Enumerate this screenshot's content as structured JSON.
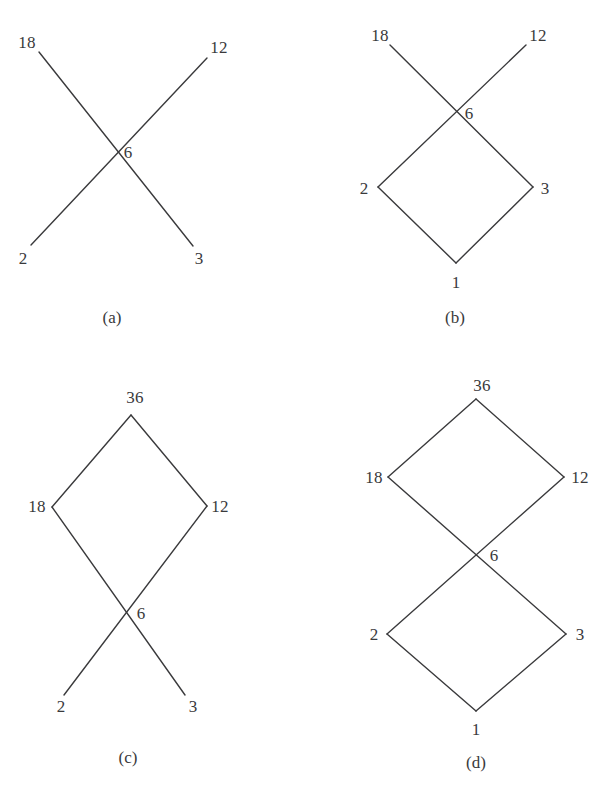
{
  "figure": {
    "type": "diagram",
    "stroke_color": "#3a3a3c",
    "text_color": "#3a3a3c",
    "background_color": "#ffffff",
    "panels": [
      {
        "id": "a",
        "caption": "(a)",
        "shape": "X-cross (two crossing segments)",
        "labels": {
          "top_left": "18",
          "top_right": "12",
          "center": "6",
          "bottom_left": "2",
          "bottom_right": "3"
        }
      },
      {
        "id": "b",
        "caption": "(b)",
        "shape": "X-cross on top of a rhombus (lower diamond)",
        "labels": {
          "top_left": "18",
          "top_right": "12",
          "center": "6",
          "left": "2",
          "right": "3",
          "bottom": "1"
        }
      },
      {
        "id": "c",
        "caption": "(c)",
        "shape": "Rhombus on top (upper diamond) with X-cross below",
        "labels": {
          "top": "36",
          "left": "18",
          "right": "12",
          "center": "6",
          "bottom_left": "2",
          "bottom_right": "3"
        }
      },
      {
        "id": "d",
        "caption": "(d)",
        "shape": "Two rhombuses meeting at a shared center vertex (bowtie of diamonds)",
        "labels": {
          "top": "36",
          "upper_left": "18",
          "upper_right": "12",
          "center": "6",
          "lower_left": "2",
          "lower_right": "3",
          "bottom": "1"
        }
      }
    ]
  }
}
